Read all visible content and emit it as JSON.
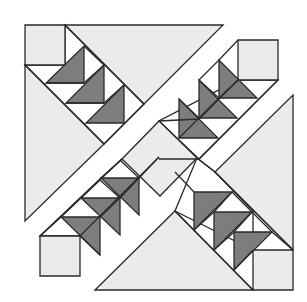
{
  "diagram": {
    "title": "",
    "colors": {
      "background": "#ffffff",
      "light_fabric": "#ebebeb",
      "dark_fabric": "#7d7d7d",
      "white_fabric": "#ffffff",
      "outline": "#2a2a2a"
    },
    "stroke_width": 1.3,
    "light_pieces": [
      {
        "name": "corner-square-top-left",
        "points": "25,25 65,25 65,65 25,65"
      },
      {
        "name": "corner-square-top-right",
        "points": "238,40 278,40 278,80 238,80"
      },
      {
        "name": "corner-square-bottom-left",
        "points": "40,236 80,236 80,276 40,276"
      },
      {
        "name": "corner-square-bottom-right",
        "points": "253,250 293,250 293,290 253,290"
      },
      {
        "name": "large-triangle-top",
        "points": "65,25 223,25 144,104"
      },
      {
        "name": "large-triangle-left",
        "points": "25,65 104,144 25,221"
      },
      {
        "name": "large-triangle-right",
        "points": "293,95 293,250 215,172"
      },
      {
        "name": "large-triangle-bottom",
        "points": "95,290 175,211 253,290"
      },
      {
        "name": "center-square-on-point",
        "points": "122,159 159,121 197,158 160,196"
      }
    ],
    "white_pieces": [
      {
        "name": "geese-strip-top-left",
        "points": "65,25 144,104 104,144 25,65 65,65"
      },
      {
        "name": "geese-strip-top-right",
        "points": "238,80 278,80 199,159 159,121"
      },
      {
        "name": "geese-strip-bottom-left",
        "points": "80,236 159,157 122,159 40,236"
      },
      {
        "name": "geese-strip-bottom-right",
        "points": "215,172 253,211 253,250 175,211 197,158"
      }
    ],
    "dark_pieces": [
      {
        "name": "goose-top-left-1",
        "points": "46,83 84,83 84,46"
      },
      {
        "name": "goose-top-left-2",
        "points": "66,103 104,103 104,65"
      },
      {
        "name": "goose-top-left-3",
        "points": "86,123 124,123 124,85"
      },
      {
        "name": "goose-top-right-1",
        "points": "219,60 219,98 257,98"
      },
      {
        "name": "goose-top-right-2",
        "points": "199,80 199,118 237,118"
      },
      {
        "name": "goose-top-right-3",
        "points": "179,99 179,138 218,138"
      },
      {
        "name": "goose-bottom-left-1",
        "points": "101,178 139,178 139,215"
      },
      {
        "name": "goose-bottom-left-2",
        "points": "81,198 120,198 120,235"
      },
      {
        "name": "goose-bottom-left-3",
        "points": "61,217 100,217 100,255"
      },
      {
        "name": "goose-bottom-right-1",
        "points": "194,192 232,192 194,230"
      },
      {
        "name": "goose-bottom-right-2",
        "points": "214,212 252,212 214,250"
      },
      {
        "name": "goose-bottom-right-3",
        "points": "234,232 272,232 234,270"
      }
    ],
    "outline_paths": [
      {
        "name": "strip-top-left-outer-edge",
        "d": "M65,25 L144,104"
      },
      {
        "name": "strip-top-left-inner-edge",
        "d": "M25,65 L104,144"
      },
      {
        "name": "strip-top-left-end",
        "d": "M144,104 L104,144"
      },
      {
        "name": "strip-top-right-outer-edge",
        "d": "M238,80 L199,119 L159,121"
      },
      {
        "name": "strip-top-right-inner-edge",
        "d": "M278,80 L199,159 L159,159"
      },
      {
        "name": "strip-bottom-left-outer-edge",
        "d": "M80,236 L159,157"
      },
      {
        "name": "strip-bottom-left-inner-edge",
        "d": "M40,236 L101,178 L122,159"
      },
      {
        "name": "strip-bottom-right-outer-edge",
        "d": "M175,211 L253,290"
      },
      {
        "name": "strip-bottom-right-inner-edge",
        "d": "M215,172 L293,250"
      },
      {
        "name": "center-to-strip-left",
        "d": "M122,159 L101,178"
      },
      {
        "name": "center-to-strip-right",
        "d": "M197,158 L215,172"
      },
      {
        "name": "goose-unit-divider-tl-1",
        "d": "M46,83 L84,83 L104,65 L84,46"
      },
      {
        "name": "goose-unit-divider-tl-2",
        "d": "M66,103 L104,103 L124,85"
      },
      {
        "name": "goose-unit-divider-tr-1",
        "d": "M219,98 L238,80"
      },
      {
        "name": "goose-unit-divider-tr-2",
        "d": "M199,118 L219,98 L199,80 L219,60 L238,40"
      },
      {
        "name": "goose-unit-divider-tr-3",
        "d": "M179,138 L199,118 L179,99"
      },
      {
        "name": "goose-unit-divider-bl-1",
        "d": "M139,178 L159,157"
      },
      {
        "name": "goose-unit-divider-bl-2",
        "d": "M120,198 L139,178 L120,160"
      },
      {
        "name": "goose-unit-divider-bl-3",
        "d": "M100,217 L120,198 L100,180 L81,198 L61,217 L40,236"
      },
      {
        "name": "goose-unit-divider-bl-4",
        "d": "M100,255 L80,236"
      },
      {
        "name": "goose-unit-divider-br-1",
        "d": "M194,192 L175,172"
      },
      {
        "name": "goose-unit-divider-br-2",
        "d": "M232,192 L252,212 L272,232 L293,250"
      },
      {
        "name": "goose-unit-divider-br-3",
        "d": "M194,230 L214,212 L232,192"
      },
      {
        "name": "goose-unit-divider-br-4",
        "d": "M214,250 L234,232 L252,212"
      },
      {
        "name": "goose-unit-divider-br-5",
        "d": "M234,270 L253,250"
      }
    ]
  }
}
